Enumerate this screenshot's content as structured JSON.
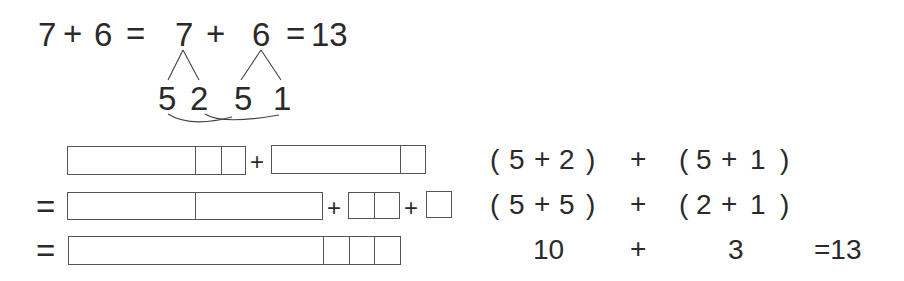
{
  "top_equation": {
    "a": "7",
    "plus1": "+",
    "b": "6",
    "eq1": "=",
    "a2": "7",
    "plus2": "+",
    "b2": "6",
    "eq2": "=",
    "result": "13"
  },
  "decomposition": {
    "seven_parts": [
      "5",
      "2"
    ],
    "six_parts": [
      "5",
      "1"
    ]
  },
  "bar_rows": [
    {
      "prefix": "",
      "segments": "[5|1|1] + [5|1]"
    },
    {
      "prefix": "=",
      "segments": "[5|5] + [1|1] + [1]"
    },
    {
      "prefix": "=",
      "segments": "[10|1|1|1]"
    }
  ],
  "symbols": {
    "plus": "+",
    "equals": "="
  },
  "expressions": [
    {
      "open1": "(",
      "x": "5",
      "op1": "+",
      "y": "2",
      "close1": ")",
      "op": "+",
      "open2": "(",
      "z": "5",
      "op2": "+",
      "w": "1",
      "close2": ")"
    },
    {
      "open1": "(",
      "x": "5",
      "op1": "+",
      "y": "5",
      "close1": ")",
      "op": "+",
      "open2": "(",
      "z": "2",
      "op2": "+",
      "w": "1",
      "close2": ")"
    },
    {
      "left": "10",
      "op": "+",
      "right": "3",
      "eq": "=13"
    }
  ]
}
